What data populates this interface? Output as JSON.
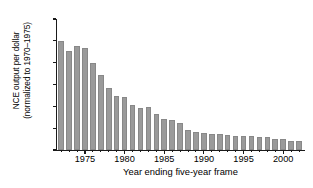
{
  "chart_data": {
    "type": "bar",
    "title": "",
    "subtitle": "",
    "xlabel": "Year ending five-year frame",
    "ylabel_line1": "NCE output per dollar",
    "ylabel_line2": "(normalized to 1970–1975)",
    "ylim": [
      0,
      120
    ],
    "ytick_labels": [
      "0",
      "20",
      "40",
      "60",
      "80",
      "100",
      "120"
    ],
    "ytick_values": [
      0,
      20,
      40,
      60,
      80,
      100,
      120
    ],
    "xlim": [
      1971.3,
      13002.7
    ],
    "xtick_labels": [
      "1975",
      "1980",
      "1985",
      "1990",
      "1995",
      "2000"
    ],
    "xtick_values": [
      1975,
      1980,
      1985,
      1990,
      1995,
      2000
    ],
    "grid": false,
    "legend": null,
    "bar_color": "#9a9a9a",
    "bar_edge_color": "#888888",
    "axis_color": "#1a1a1a",
    "categories": [
      1972,
      1973,
      1974,
      1975,
      1976,
      1977,
      1978,
      1979,
      1980,
      1981,
      1982,
      1983,
      1984,
      1985,
      1986,
      1987,
      1988,
      1989,
      1990,
      1991,
      1992,
      1993,
      1994,
      1995,
      1996,
      1997,
      1998,
      1999,
      2000,
      2001,
      2002
    ],
    "values": [
      100,
      91,
      95,
      93,
      80,
      69,
      57,
      49.5,
      48.5,
      41,
      38.5,
      39.5,
      33,
      28.5,
      27.5,
      24.5,
      18,
      16.5,
      15.5,
      15,
      14.5,
      13.5,
      13,
      12.5,
      12.5,
      12,
      11.5,
      10,
      10,
      8.5,
      8
    ]
  }
}
